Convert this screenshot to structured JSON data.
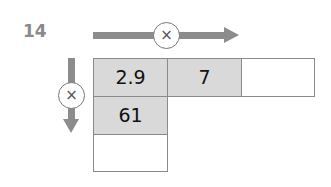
{
  "question_number": "14",
  "operators": {
    "horizontal": "×",
    "vertical": "×"
  },
  "grid": {
    "row1": [
      "2.9",
      "7",
      ""
    ],
    "col1": [
      "2.9",
      "61",
      ""
    ]
  },
  "colors": {
    "arrow": "#8c8c8c",
    "shaded_cell": "#d9d9d9",
    "border": "#8a8a8a"
  }
}
